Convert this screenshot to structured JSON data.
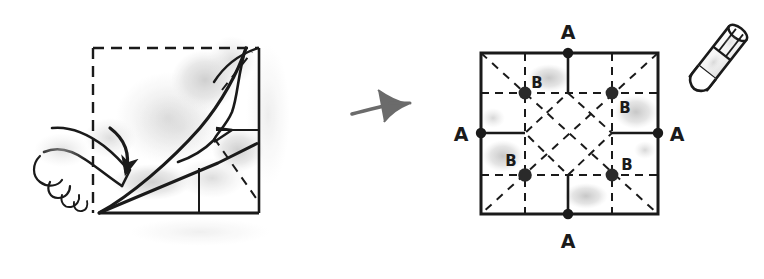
{
  "figure": {
    "type": "origami-instruction-diagram",
    "background_color": "#ffffff",
    "ink_color": "#1a1a1a",
    "pencil_shadow_color": "#c9c9c9",
    "panels": [
      {
        "id": "left-panel",
        "name": "folding-action-panel",
        "description": "Hand pressing a folded triangular flap down onto a square sheet; curved arrow shows fold direction",
        "square": {
          "x": 93,
          "y": 48,
          "width": 166,
          "height": 165
        },
        "edges": {
          "top": "dashed",
          "left": "dashed",
          "right": "solid",
          "bottom": "solid"
        },
        "elements": [
          {
            "name": "finger-hand",
            "kind": "drawing"
          },
          {
            "name": "fold-direction-arrow",
            "kind": "curved-arrow"
          },
          {
            "name": "folded-flap",
            "kind": "paper-flap"
          },
          {
            "name": "crease-diagonal",
            "kind": "dashed-line"
          },
          {
            "name": "pencil-shading",
            "kind": "shadow"
          }
        ]
      },
      {
        "id": "right-panel",
        "name": "crease-pattern-panel",
        "description": "Unfolded square showing the resulting crease pattern with labelled points A on edge midpoints and B at quarter intersections",
        "square": {
          "x": 481,
          "y": 53,
          "width": 177,
          "height": 161
        },
        "edges": {
          "top": "solid",
          "left": "solid",
          "right": "solid",
          "bottom": "solid"
        },
        "grid": {
          "divisions": 4,
          "vertical_lines": "dashed",
          "horizontal_lines": "dashed",
          "inner_diamond": "dashed",
          "diagonals": "dashed"
        }
      }
    ],
    "transition_arrow": {
      "name": "step-transition-arrow",
      "x": 352,
      "y": 108,
      "direction": "right",
      "style": "hand-drawn"
    },
    "pencil": {
      "name": "pencil-tool",
      "x": 700,
      "y": 70,
      "angle": -40,
      "description": "Stubby pencil drawn at upper right, pointing down-left"
    },
    "point_labels": {
      "a_label": "A",
      "b_label": "B",
      "a_points": [
        {
          "label": "A",
          "position": "top-edge-midpoint",
          "dot": {
            "x": 568,
            "y": 53
          },
          "text": {
            "x": 568,
            "y": 33
          }
        },
        {
          "label": "A",
          "position": "left-edge-midpoint",
          "dot": {
            "x": 481,
            "y": 133
          },
          "text": {
            "x": 461,
            "y": 140
          }
        },
        {
          "label": "A",
          "position": "right-edge-midpoint",
          "dot": {
            "x": 658,
            "y": 133
          },
          "text": {
            "x": 676,
            "y": 140
          }
        },
        {
          "label": "A",
          "position": "bottom-edge-midpoint",
          "dot": {
            "x": 568,
            "y": 214
          },
          "text": {
            "x": 568,
            "y": 243
          }
        }
      ],
      "b_points": [
        {
          "label": "B",
          "position": "upper-left-quarter",
          "dot": {
            "x": 525,
            "y": 93
          },
          "text": {
            "x": 537,
            "y": 85
          }
        },
        {
          "label": "B",
          "position": "upper-right-quarter",
          "dot": {
            "x": 612,
            "y": 93
          },
          "text": {
            "x": 624,
            "y": 109
          }
        },
        {
          "label": "B",
          "position": "lower-left-quarter",
          "dot": {
            "x": 525,
            "y": 175
          },
          "text": {
            "x": 511,
            "y": 164
          }
        },
        {
          "label": "B",
          "position": "lower-right-quarter",
          "dot": {
            "x": 612,
            "y": 175
          },
          "text": {
            "x": 626,
            "y": 168
          }
        }
      ]
    }
  }
}
